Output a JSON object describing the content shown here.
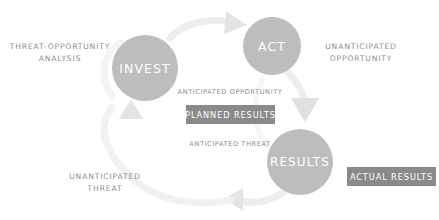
{
  "diagram": {
    "colors": {
      "node_fill": "#bdbdbd",
      "node_text": "#ffffff",
      "chip_fill": "#8a8a8a",
      "chip_text": "#ffffff",
      "annotation_text": "#8d8d8d",
      "arc": "#ededed",
      "arrowhead": "#e0e0e0",
      "background": "#ffffff"
    },
    "nodes": [
      {
        "id": "invest",
        "label": "INVEST"
      },
      {
        "id": "act",
        "label": "ACT"
      },
      {
        "id": "results",
        "label": "RESULTS"
      }
    ],
    "annotations": [
      {
        "id": "threat_opportunity_analysis",
        "text": "THREAT-OPPORTUNITY\nANALYSIS"
      },
      {
        "id": "unanticipated_opportunity",
        "text": "UNANTICIPATED\nOPPORTUNITY"
      },
      {
        "id": "unanticipated_threat",
        "text": "UNANTICIPATED\nTHREAT"
      },
      {
        "id": "anticipated_opportunity",
        "text": "ANTICIPATED OPPORTUNITY"
      },
      {
        "id": "anticipated_threat",
        "text": "ANTICIPATED THREAT"
      }
    ],
    "chips": [
      {
        "id": "planned_results",
        "label": "PLANNED RESULTS"
      },
      {
        "id": "actual_results",
        "label": "ACTUAL RESULTS"
      }
    ]
  }
}
